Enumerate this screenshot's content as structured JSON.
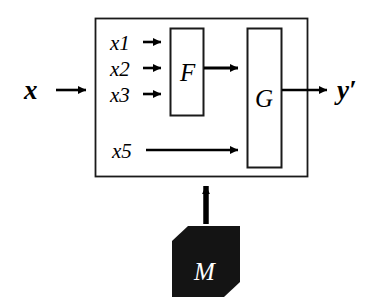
{
  "diagram": {
    "colors": {
      "background": "#ffffff",
      "stroke": "#000000",
      "outer_box_stroke": "#1a1a1a",
      "solid_block_fill": "#141414",
      "solid_block_text": "#ffffff"
    },
    "io": {
      "input_label": "x",
      "output_label": "y′"
    },
    "inputs": [
      {
        "label": "x1"
      },
      {
        "label": "x2"
      },
      {
        "label": "x3"
      },
      {
        "label": "x5"
      }
    ],
    "blocks": [
      {
        "label": "F",
        "style": "outlined"
      },
      {
        "label": "G",
        "style": "outlined"
      },
      {
        "label": "M",
        "style": "filled"
      }
    ],
    "connections": [
      {
        "from": "x",
        "to": "system-boundary"
      },
      {
        "from": "x1",
        "to": "F"
      },
      {
        "from": "x2",
        "to": "F"
      },
      {
        "from": "x3",
        "to": "F"
      },
      {
        "from": "F",
        "to": "G"
      },
      {
        "from": "x5",
        "to": "G"
      },
      {
        "from": "G",
        "to": "y′"
      },
      {
        "from": "M",
        "to": "system-boundary"
      }
    ]
  }
}
